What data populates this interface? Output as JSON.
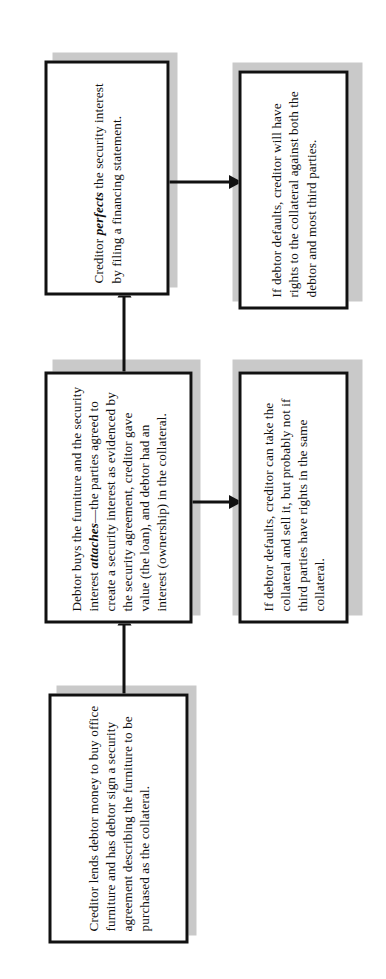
{
  "figure": {
    "type": "flowchart",
    "orientation": "rotated-90-ccw",
    "background_color": "#ffffff",
    "box_border_color": "#111111",
    "box_fill_color": "#ffffff",
    "shadow_color": "#c9c9c9",
    "connector_color": "#111111"
  },
  "nodes": {
    "step1": {
      "id": "step1",
      "text": "Creditor lends debtor money to buy office furniture and has debtor sign a security agreement describing the furniture to be purchased as the collateral."
    },
    "step2": {
      "id": "step2",
      "text_before": "Debtor buys the furniture and the security interest ",
      "emphasis": "attaches",
      "text_after": "—the parties agreed to create a security interest as evidenced by the security agreement, creditor gave value (the loan), and debtor had an interest (ownership) in the collateral."
    },
    "step3": {
      "id": "step3",
      "text_before": "Creditor ",
      "emphasis": "perfects",
      "text_after": " the security interest by filing a financing statement."
    },
    "outcome2": {
      "id": "outcome2",
      "text": "If debtor defaults, creditor can take the collateral and sell it, but probably not if third parties have rights in the same collateral."
    },
    "outcome3": {
      "id": "outcome3",
      "text": "If debtor defaults, creditor will have rights to the collateral against both the debtor and most third parties."
    }
  },
  "edges": [
    {
      "id": "edge-step1-step2",
      "from": "step1",
      "to": "step2",
      "style": "arrow"
    },
    {
      "id": "edge-step2-step3",
      "from": "step2",
      "to": "step3",
      "style": "arrow"
    },
    {
      "id": "edge-step2-outcome2",
      "from": "step2",
      "to": "outcome2",
      "style": "arrow"
    },
    {
      "id": "edge-step3-outcome3",
      "from": "step3",
      "to": "outcome3",
      "style": "arrow"
    }
  ]
}
